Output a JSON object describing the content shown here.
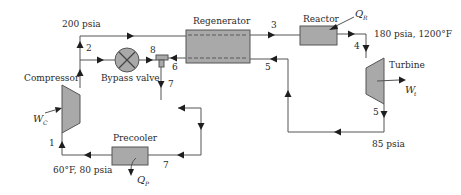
{
  "diagram": {
    "colors": {
      "component_fill": "#a9a9a9",
      "line": "#555555",
      "arrow": "#1e1e1e",
      "background": "#ffffff"
    },
    "components": {
      "compressor": {
        "label": "Compressor",
        "work_symbol": "W",
        "work_subscript": "C"
      },
      "bypass_valve": {
        "label": "Bypass valve"
      },
      "regenerator": {
        "label": "Regenerator"
      },
      "reactor": {
        "label": "Reactor",
        "heat_symbol": "Q",
        "heat_subscript": "R"
      },
      "turbine": {
        "label": "Turbine",
        "work_symbol": "W",
        "work_subscript": "t"
      },
      "precooler": {
        "label": "Precooler",
        "heat_symbol": "Q",
        "heat_subscript": "P"
      }
    },
    "states": [
      "1",
      "2",
      "3",
      "4",
      "5",
      "6",
      "7",
      "8"
    ],
    "state_labels": {
      "s1": "1",
      "s2": "2",
      "s3": "3",
      "s4": "4",
      "s5a": "5",
      "s5b": "5",
      "s6": "6",
      "s7a": "7",
      "s7b": "7",
      "s8": "8"
    },
    "conditions": {
      "compressor_outlet": "200 psia",
      "turbine_inlet": "180 psia, 1200°F",
      "turbine_outlet": "85 psia",
      "compressor_inlet": "60°F, 80 psia"
    }
  }
}
